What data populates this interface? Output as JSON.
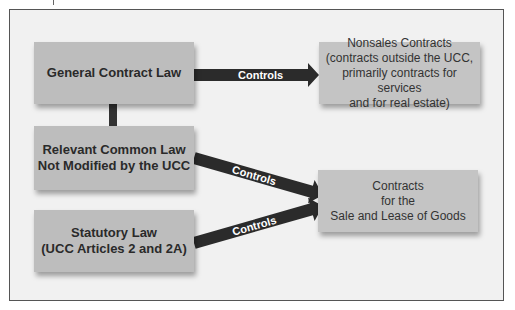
{
  "diagram": {
    "left_boxes": [
      {
        "id": "general",
        "label": "General Contract Law"
      },
      {
        "id": "common",
        "line1": "Relevant Common Law",
        "line2": "Not Modified by the UCC"
      },
      {
        "id": "statutory",
        "line1": "Statutory Law",
        "line2": "(UCC Articles 2 and 2A)"
      }
    ],
    "right_boxes": [
      {
        "id": "nonsales",
        "lines": [
          "Nonsales Contracts",
          "(contracts outside the UCC,",
          "primarily contracts for services",
          "and for real estate)"
        ]
      },
      {
        "id": "goods",
        "lines": [
          "Contracts",
          "for the",
          "Sale and Lease of Goods"
        ]
      }
    ],
    "arrows": [
      {
        "from": "general",
        "to": "nonsales",
        "label": "Controls"
      },
      {
        "from": "common",
        "to": "goods",
        "label": "Controls"
      },
      {
        "from": "statutory",
        "to": "goods",
        "label": "Controls"
      }
    ],
    "colors": {
      "panel_bg": "#f1f1f1",
      "box_bg": "#bdbdbd",
      "arrow": "#2b2b2b",
      "border": "#555555"
    }
  }
}
